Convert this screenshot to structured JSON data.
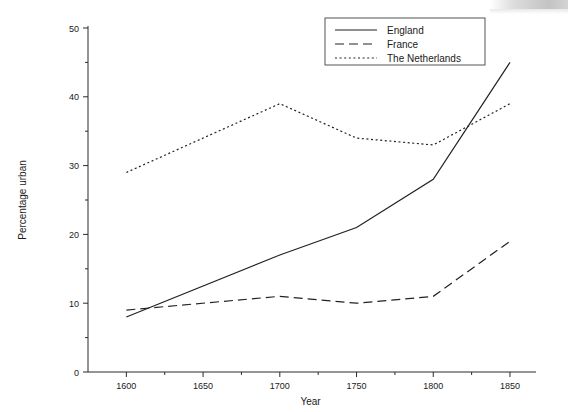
{
  "chart_data": {
    "type": "line",
    "title": "",
    "xlabel": "Year",
    "ylabel": "Percentage urban",
    "x": [
      1600,
      1700,
      1750,
      1800,
      1850
    ],
    "xlim": [
      1575,
      1865
    ],
    "ylim": [
      0,
      50
    ],
    "xticks": [
      1600,
      1650,
      1700,
      1750,
      1800,
      1850
    ],
    "xtick_labels": [
      "1600",
      "1650",
      "1700",
      "1750",
      "1800",
      "1850"
    ],
    "xminor_ticks": [
      1625,
      1675,
      1725,
      1775,
      1825
    ],
    "yticks": [
      0,
      10,
      20,
      30,
      40,
      50
    ],
    "ytick_labels": [
      "0",
      "10",
      "20",
      "30",
      "40",
      "50"
    ],
    "yminor_ticks": [
      5,
      15,
      25,
      35,
      45
    ],
    "grid": false,
    "legend_position": "top-right",
    "series": [
      {
        "name": "England",
        "style": "solid",
        "color": "#222222",
        "x": [
          1600,
          1700,
          1750,
          1800,
          1850
        ],
        "values": [
          8,
          17,
          21,
          28,
          45
        ]
      },
      {
        "name": "France",
        "style": "dashed",
        "color": "#222222",
        "x": [
          1600,
          1700,
          1750,
          1800,
          1850
        ],
        "values": [
          9,
          11,
          10,
          11,
          19
        ]
      },
      {
        "name": "The Netherlands",
        "style": "dotted",
        "color": "#222222",
        "x": [
          1600,
          1700,
          1750,
          1800,
          1850
        ],
        "values": [
          29,
          39,
          34,
          33,
          39
        ]
      }
    ]
  },
  "axes": {
    "x_title": "Year",
    "y_title": "Percentage urban"
  },
  "legend": {
    "items": [
      {
        "label": "England",
        "style": "solid"
      },
      {
        "label": "France",
        "style": "dashed"
      },
      {
        "label": "The Netherlands",
        "style": "dotted"
      }
    ]
  }
}
